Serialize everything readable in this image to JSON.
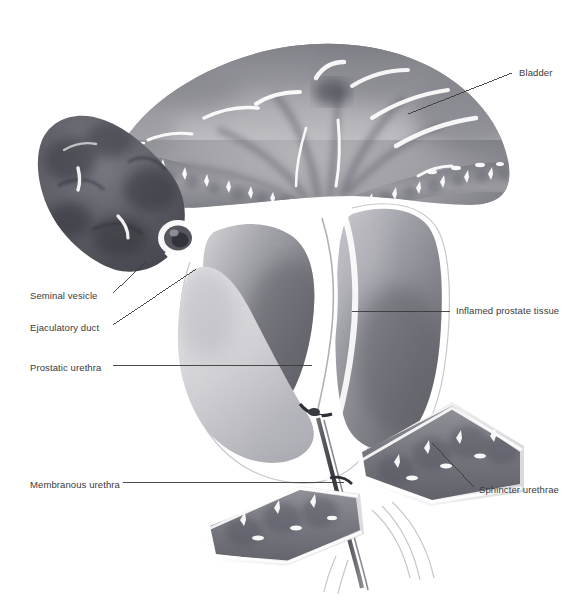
{
  "figure": {
    "style": "grayscale airbrush medical illustration",
    "background_color": "#ffffff",
    "line_color": "#3a3a3a",
    "text_color": "#3a3a3a"
  },
  "labels": [
    {
      "id": "bladder",
      "text": "Bladder",
      "side": "right",
      "x": 519,
      "y": 73,
      "leader": [
        [
          512,
          73
        ],
        [
          408,
          114
        ]
      ]
    },
    {
      "id": "seminal-vesicle",
      "text": "Seminal vesicle",
      "side": "left",
      "x": 30,
      "y": 296,
      "leader": [
        [
          113,
          293
        ],
        [
          146,
          262
        ]
      ]
    },
    {
      "id": "ejaculatory-duct",
      "text": "Ejaculatory duct",
      "side": "left",
      "x": 30,
      "y": 328,
      "leader": [
        [
          113,
          325
        ],
        [
          196,
          269
        ]
      ]
    },
    {
      "id": "prostatic-urethra",
      "text": "Prostatic urethra",
      "side": "left",
      "x": 30,
      "y": 368,
      "leader": [
        [
          113,
          365
        ],
        [
          312,
          365
        ]
      ]
    },
    {
      "id": "membranous-urethra",
      "text": "Membranous urethra",
      "side": "left",
      "x": 30,
      "y": 485,
      "leader": [
        [
          123,
          482
        ],
        [
          344,
          482
        ]
      ]
    },
    {
      "id": "inflamed-prostate",
      "text": "Inflamed prostate tissue",
      "side": "right",
      "x": 456,
      "y": 311,
      "leader": [
        [
          450,
          311
        ],
        [
          352,
          311
        ]
      ]
    },
    {
      "id": "sphincter-urethrae",
      "text": "Sphincter urethrae",
      "side": "right",
      "x": 479,
      "y": 490,
      "leader": [
        [
          474,
          487
        ],
        [
          432,
          443
        ]
      ]
    }
  ],
  "structures": [
    {
      "id": "bladder",
      "name": "Bladder",
      "tone": "#9d9da2"
    },
    {
      "id": "bladder-mucosa",
      "name": "Bladder mucosa folds",
      "tone": "#8a8a90"
    },
    {
      "id": "seminal-vesicle",
      "name": "Seminal vesicle",
      "tone": "#62626a"
    },
    {
      "id": "ejaculatory-duct",
      "name": "Ejaculatory duct",
      "tone": "#ffffff"
    },
    {
      "id": "prostate-left-lobe",
      "name": "Left prostate lobe",
      "tone": "#8e8e94"
    },
    {
      "id": "prostate-right-lobe",
      "name": "Right prostate lobe",
      "tone": "#8e8e94"
    },
    {
      "id": "prostatic-urethra",
      "name": "Prostatic urethra",
      "tone": "#f2f2f2"
    },
    {
      "id": "membranous-urethra",
      "name": "Membranous urethra",
      "tone": "#444448"
    },
    {
      "id": "sphincter-upper",
      "name": "Sphincter urethrae (upper band)",
      "tone": "#83838a"
    },
    {
      "id": "sphincter-lower",
      "name": "Sphincter urethrae (lower band)",
      "tone": "#83838a"
    }
  ]
}
